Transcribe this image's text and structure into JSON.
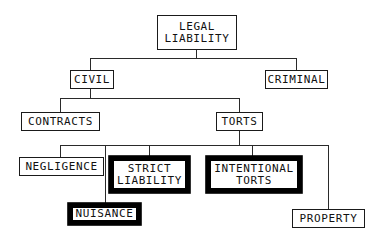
{
  "diagram": {
    "type": "hierarchy-tree",
    "background_color": "#ffffff",
    "line_color": "#2a2a2a",
    "text_color": "#111111",
    "emphasis_border_color": "#000000"
  },
  "nodes": {
    "legal_liability": {
      "line1": "LEGAL",
      "line2": "LIABILITY",
      "emphasis": "normal",
      "level": 0
    },
    "civil": {
      "line1": "CIVIL",
      "emphasis": "normal",
      "level": 1
    },
    "criminal": {
      "line1": "CRIMINAL",
      "emphasis": "normal",
      "level": 1
    },
    "contracts": {
      "line1": "CONTRACTS",
      "emphasis": "normal",
      "level": 2
    },
    "torts": {
      "line1": "TORTS",
      "emphasis": "normal",
      "level": 2
    },
    "negligence": {
      "line1": "NEGLIGENCE",
      "emphasis": "normal",
      "level": 3
    },
    "strict_liability": {
      "line1": "STRICT",
      "line2": "LIABILITY",
      "emphasis": "bold",
      "level": 3
    },
    "intentional_torts": {
      "line1": "INTENTIONAL",
      "line2": "TORTS",
      "emphasis": "bold",
      "level": 3
    },
    "property": {
      "line1": "PROPERTY",
      "emphasis": "normal",
      "level": 3
    },
    "nuisance": {
      "line1": "NUISANCE",
      "emphasis": "bold",
      "level": 4
    }
  }
}
